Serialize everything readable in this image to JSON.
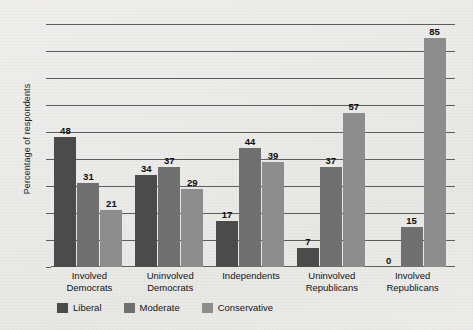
{
  "chart_data": {
    "type": "bar",
    "title": "",
    "xlabel": "",
    "ylabel": "Percentage of respondents",
    "ylim": [
      0,
      90
    ],
    "yticks": [
      0,
      10,
      20,
      30,
      40,
      50,
      60,
      70,
      80,
      90
    ],
    "grid": true,
    "legend_position": "bottom-left",
    "categories": [
      "Involved Democrats",
      "Uninvolved Democrats",
      "Independents",
      "Uninvolved Republicans",
      "Involved Republicans"
    ],
    "category_lines": [
      [
        "Involved",
        "Democrats"
      ],
      [
        "Uninvolved",
        "Democrats"
      ],
      [
        "Independents"
      ],
      [
        "Uninvolved",
        "Republicans"
      ],
      [
        "Involved",
        "Republicans"
      ]
    ],
    "series": [
      {
        "name": "Liberal",
        "color": "#4b4b4b",
        "values": [
          48,
          34,
          17,
          7,
          0
        ]
      },
      {
        "name": "Moderate",
        "color": "#707070",
        "values": [
          31,
          37,
          44,
          37,
          15
        ]
      },
      {
        "name": "Conservative",
        "color": "#8d8d8d",
        "values": [
          21,
          29,
          39,
          57,
          85
        ]
      }
    ]
  }
}
